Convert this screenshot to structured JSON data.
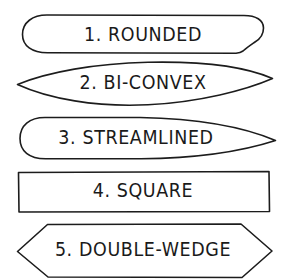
{
  "diagram": {
    "background_color": "#ffffff",
    "line_color": "#1c1c1c",
    "text_color": "#1a1a1a",
    "shapes": [
      {
        "index": "1",
        "label": "1. ROUNDED",
        "name": "ROUNDED",
        "outline": "stadium"
      },
      {
        "index": "2",
        "label": "2. BI-CONVEX",
        "name": "BI-CONVEX",
        "outline": "lens"
      },
      {
        "index": "3",
        "label": "3. STREAMLINED",
        "name": "STREAMLINED",
        "outline": "rounded-leading-pointed-trailing"
      },
      {
        "index": "4",
        "label": "4. SQUARE",
        "name": "SQUARE",
        "outline": "rectangle"
      },
      {
        "index": "5",
        "label": "5. DOUBLE-WEDGE",
        "name": "DOUBLE-WEDGE",
        "outline": "hexagon"
      }
    ]
  }
}
